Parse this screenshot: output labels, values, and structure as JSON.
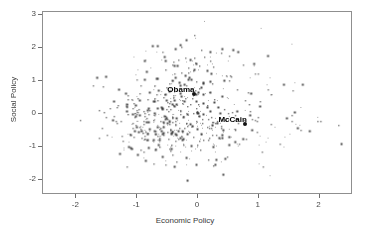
{
  "chart_data": {
    "type": "scatter",
    "title": "",
    "xlabel": "Economic Policy",
    "ylabel": "Social Policy",
    "xlim": [
      -2.55,
      2.55
    ],
    "ylim": [
      -2.45,
      3.1
    ],
    "xticks": [
      -2,
      -1,
      0,
      1,
      2
    ],
    "xtick_labels": [
      "-2",
      "-1",
      "0",
      "1",
      "2"
    ],
    "yticks": [
      -2,
      -1,
      0,
      1,
      2,
      3
    ],
    "ytick_labels": [
      "-2",
      "-1",
      "0",
      "1",
      "2",
      "3"
    ],
    "grid": false,
    "legend": "none",
    "marker": "small-point",
    "point_color": "#3a3a3a",
    "n_points": 620,
    "annotations": [
      {
        "label": "Obama",
        "x": -0.06,
        "y": 0.6,
        "marker": "filled-dot"
      },
      {
        "label": "McCain",
        "x": 0.78,
        "y": -0.3,
        "marker": "filled-dot"
      }
    ],
    "cloud_description": "dense central cloud of respondent ideal points, densest near x=-0.7 to 0.3 and y=-1 to 0.7, thinning to the right and at extremes"
  },
  "axes": {
    "frame_color": "#8f8f8f",
    "tick_color": "#6e6e6e",
    "label_color": "#3a3a3a"
  }
}
